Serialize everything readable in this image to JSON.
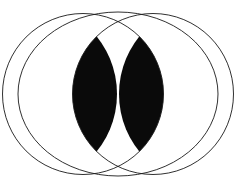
{
  "figure": {
    "caption": "",
    "background_color": "#ffffff",
    "stroke_color": "#1a1a1a",
    "fill_color": "#0a0a0a",
    "center_dot_color": "#ffffff",
    "stroke_width": 0.9,
    "canvas": {
      "width": 235,
      "height": 191
    }
  },
  "geometry": {
    "center": {
      "x": 118,
      "y": 94
    },
    "outer_ellipse": {
      "name": "outer-ellipse",
      "cx": 118,
      "cy": 94,
      "rx": 100,
      "ry": 82
    },
    "circles": [
      {
        "name": "left-circle",
        "cx": 83,
        "cy": 94,
        "r": 80.5
      },
      {
        "name": "right-circle",
        "cx": 153,
        "cy": 94,
        "r": 80.5
      }
    ],
    "lenses": [
      {
        "name": "left-lens",
        "description": "Filled vesica between left circle and an offset right-shifted circle",
        "circle_a": {
          "cx": 25,
          "cy": 94,
          "r": 92
        },
        "circle_b": {
          "cx": 153,
          "cy": 94,
          "r": 80.5
        }
      },
      {
        "name": "right-lens",
        "description": "Filled vesica between right circle and an offset left-shifted circle",
        "circle_a": {
          "cx": 211,
          "cy": 94,
          "r": 92
        },
        "circle_b": {
          "cx": 83,
          "cy": 94,
          "r": 80.5
        }
      }
    ],
    "crossing_points": [
      {
        "name": "top-crossing",
        "x": 118,
        "y": 13
      },
      {
        "name": "bottom-crossing",
        "x": 118,
        "y": 172
      }
    ],
    "center_dot": {
      "name": "center-dot",
      "cx": 118,
      "cy": 98,
      "r": 1.1
    }
  }
}
